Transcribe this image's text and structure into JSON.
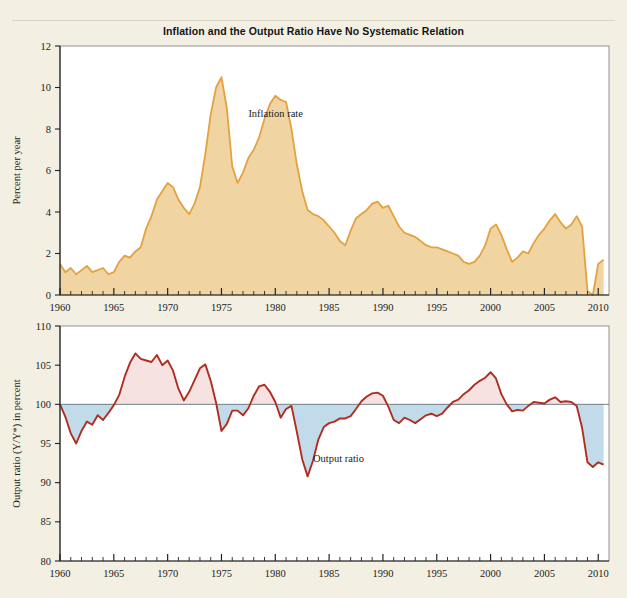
{
  "figure": {
    "title": "Inflation and the Output Ratio Have No Systematic Relation",
    "background_color": "#f3f0e3"
  },
  "chart_data": [
    {
      "id": "inflation-panel",
      "type": "area",
      "title": "Inflation rate",
      "xlabel": "",
      "ylabel": "Percent per year",
      "xlim": [
        1960,
        2011
      ],
      "ylim": [
        0,
        12
      ],
      "yticks": [
        0,
        2,
        4,
        6,
        8,
        10,
        12
      ],
      "xticks": [
        1960,
        1965,
        1970,
        1975,
        1980,
        1985,
        1990,
        1995,
        2000,
        2005,
        2010
      ],
      "minor_x_tick_interval": 1,
      "grid": false,
      "legend": "none",
      "annotations": [
        {
          "text": "Inflation rate",
          "x": 1977.5,
          "y": 8.6
        }
      ],
      "line_color": "#e3a23f",
      "fill_color": "#f0d5a3",
      "series": [
        {
          "name": "Inflation rate",
          "x": [
            1960.0,
            1960.5,
            1961.0,
            1961.5,
            1962.0,
            1962.5,
            1963.0,
            1963.5,
            1964.0,
            1964.5,
            1965.0,
            1965.5,
            1966.0,
            1966.5,
            1967.0,
            1967.5,
            1968.0,
            1968.5,
            1969.0,
            1969.5,
            1970.0,
            1970.5,
            1971.0,
            1971.5,
            1972.0,
            1972.5,
            1973.0,
            1973.5,
            1974.0,
            1974.5,
            1975.0,
            1975.5,
            1976.0,
            1976.5,
            1977.0,
            1977.5,
            1978.0,
            1978.5,
            1979.0,
            1979.5,
            1980.0,
            1980.5,
            1981.0,
            1981.5,
            1982.0,
            1982.5,
            1983.0,
            1983.5,
            1984.0,
            1984.5,
            1985.0,
            1985.5,
            1986.0,
            1986.5,
            1987.0,
            1987.5,
            1988.0,
            1988.5,
            1989.0,
            1989.5,
            1990.0,
            1990.5,
            1991.0,
            1991.5,
            1992.0,
            1992.5,
            1993.0,
            1993.5,
            1994.0,
            1994.5,
            1995.0,
            1995.5,
            1996.0,
            1996.5,
            1997.0,
            1997.5,
            1998.0,
            1998.5,
            1999.0,
            1999.5,
            2000.0,
            2000.5,
            2001.0,
            2001.5,
            2002.0,
            2002.5,
            2003.0,
            2003.5,
            2004.0,
            2004.5,
            2005.0,
            2005.5,
            2006.0,
            2006.5,
            2007.0,
            2007.5,
            2008.0,
            2008.5,
            2009.0,
            2009.5,
            2010.0,
            2010.5
          ],
          "values": [
            1.5,
            1.1,
            1.3,
            1.0,
            1.2,
            1.4,
            1.1,
            1.2,
            1.3,
            1.0,
            1.1,
            1.6,
            1.9,
            1.8,
            2.1,
            2.3,
            3.2,
            3.8,
            4.6,
            5.0,
            5.4,
            5.2,
            4.6,
            4.2,
            3.9,
            4.4,
            5.2,
            6.8,
            8.7,
            10.0,
            10.5,
            9.0,
            6.2,
            5.4,
            5.9,
            6.6,
            7.0,
            7.6,
            8.5,
            9.2,
            9.6,
            9.4,
            9.3,
            8.0,
            6.3,
            5.0,
            4.1,
            3.9,
            3.8,
            3.6,
            3.3,
            3.0,
            2.6,
            2.4,
            3.1,
            3.7,
            3.9,
            4.1,
            4.4,
            4.5,
            4.2,
            4.3,
            3.8,
            3.3,
            3.0,
            2.9,
            2.8,
            2.6,
            2.4,
            2.3,
            2.3,
            2.2,
            2.1,
            2.0,
            1.9,
            1.6,
            1.5,
            1.6,
            1.9,
            2.4,
            3.2,
            3.4,
            2.9,
            2.2,
            1.6,
            1.8,
            2.1,
            2.0,
            2.5,
            2.9,
            3.2,
            3.6,
            3.9,
            3.5,
            3.2,
            3.4,
            3.8,
            3.3,
            0.2,
            0.0,
            1.5,
            1.7
          ]
        }
      ]
    },
    {
      "id": "output-ratio-panel",
      "type": "line",
      "title": "Output ratio",
      "xlabel": "",
      "ylabel": "Output ratio (Y/Y*) in percent",
      "xlim": [
        1960,
        2011
      ],
      "ylim": [
        80,
        110
      ],
      "yticks": [
        80,
        85,
        90,
        95,
        100,
        105,
        110
      ],
      "xticks": [
        1960,
        1965,
        1970,
        1975,
        1980,
        1985,
        1990,
        1995,
        2000,
        2005,
        2010
      ],
      "minor_x_tick_interval": 1,
      "grid": false,
      "legend": "none",
      "reference_line": 100,
      "annotations": [
        {
          "text": "Output ratio",
          "x": 1983.5,
          "y": 92.7
        }
      ],
      "line_color": "#b02d20",
      "fill_above_color": "#f6e2e1",
      "fill_below_color": "#c2dbea",
      "series": [
        {
          "name": "Output ratio",
          "x": [
            1960.0,
            1960.5,
            1961.0,
            1961.5,
            1962.0,
            1962.5,
            1963.0,
            1963.5,
            1964.0,
            1964.5,
            1965.0,
            1965.5,
            1966.0,
            1966.5,
            1967.0,
            1967.5,
            1968.0,
            1968.5,
            1969.0,
            1969.5,
            1970.0,
            1970.5,
            1971.0,
            1971.5,
            1972.0,
            1972.5,
            1973.0,
            1973.5,
            1974.0,
            1974.5,
            1975.0,
            1975.5,
            1976.0,
            1976.5,
            1977.0,
            1977.5,
            1978.0,
            1978.5,
            1979.0,
            1979.5,
            1980.0,
            1980.5,
            1981.0,
            1981.5,
            1982.0,
            1982.5,
            1983.0,
            1983.5,
            1984.0,
            1984.5,
            1985.0,
            1985.5,
            1986.0,
            1986.5,
            1987.0,
            1987.5,
            1988.0,
            1988.5,
            1989.0,
            1989.5,
            1990.0,
            1990.5,
            1991.0,
            1991.5,
            1992.0,
            1992.5,
            1993.0,
            1993.5,
            1994.0,
            1994.5,
            1995.0,
            1995.5,
            1996.0,
            1996.5,
            1997.0,
            1997.5,
            1998.0,
            1998.5,
            1999.0,
            1999.5,
            2000.0,
            2000.5,
            2001.0,
            2001.5,
            2002.0,
            2002.5,
            2003.0,
            2003.5,
            2004.0,
            2004.5,
            2005.0,
            2005.5,
            2006.0,
            2006.5,
            2007.0,
            2007.5,
            2008.0,
            2008.5,
            2009.0,
            2009.5,
            2010.0,
            2010.5
          ],
          "values": [
            100.0,
            98.4,
            96.3,
            95.0,
            96.6,
            97.8,
            97.4,
            98.6,
            98.0,
            98.9,
            99.9,
            101.2,
            103.5,
            105.3,
            106.5,
            105.8,
            105.6,
            105.4,
            106.3,
            105.0,
            105.6,
            104.3,
            102.0,
            100.5,
            101.6,
            103.1,
            104.6,
            105.1,
            103.0,
            100.2,
            96.6,
            97.5,
            99.2,
            99.2,
            98.6,
            99.5,
            101.1,
            102.3,
            102.5,
            101.6,
            100.3,
            98.3,
            99.4,
            99.8,
            96.5,
            93.0,
            90.8,
            92.8,
            95.5,
            97.1,
            97.6,
            97.8,
            98.2,
            98.2,
            98.5,
            99.4,
            100.4,
            101.0,
            101.4,
            101.5,
            101.1,
            99.7,
            98.0,
            97.6,
            98.3,
            98.0,
            97.6,
            98.1,
            98.6,
            98.8,
            98.5,
            98.8,
            99.6,
            100.3,
            100.6,
            101.3,
            101.8,
            102.5,
            103.0,
            103.4,
            104.1,
            103.3,
            101.3,
            100.0,
            99.1,
            99.3,
            99.2,
            99.8,
            100.3,
            100.2,
            100.1,
            100.6,
            100.9,
            100.3,
            100.4,
            100.3,
            99.8,
            97.0,
            92.6,
            92.0,
            92.6,
            92.3
          ]
        }
      ]
    }
  ]
}
